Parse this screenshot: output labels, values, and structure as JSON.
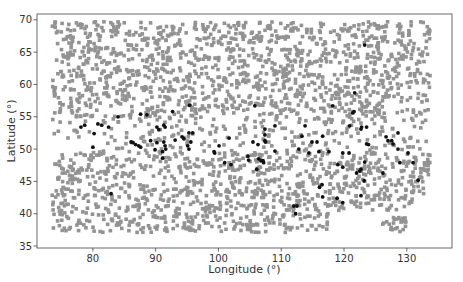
{
  "chart_data": {
    "type": "scatter",
    "title": "",
    "xlabel": "Longitude (°)",
    "ylabel": "Latitude (°)",
    "xlim": [
      71.1,
      137.2
    ],
    "ylim": [
      34.7,
      70.9
    ],
    "xticks": [
      80,
      90,
      100,
      110,
      120,
      130
    ],
    "yticks": [
      35,
      40,
      45,
      50,
      55,
      60,
      65,
      70
    ],
    "grid": false,
    "legend": null,
    "series": [
      {
        "name": "all_points",
        "color": "#939393",
        "marker_size": 4,
        "distribution": {
          "lon_range": [
            73.5,
            133.7
          ],
          "lat_range": [
            37.1,
            69.7
          ],
          "count": 2600,
          "seed": 7,
          "sparse_band_lat": [
            49.5,
            54.5
          ],
          "right_cutoff": {
            "lon_min": 117.5,
            "lat_max": 40.5
          },
          "right_cluster": {
            "lon_range": [
              126.0,
              130.0
            ],
            "lat_range": [
              37.2,
              39.5
            ],
            "count": 25
          }
        }
      },
      {
        "name": "highlighted_points",
        "color": "#111111",
        "marker_size": 4,
        "points": [
          [
            84.0,
            55.0
          ],
          [
            87.6,
            55.4
          ],
          [
            88.6,
            55.3
          ],
          [
            78.1,
            53.4
          ],
          [
            78.7,
            53.7
          ],
          [
            80.8,
            53.9
          ],
          [
            81.4,
            53.7
          ],
          [
            82.5,
            53.4
          ],
          [
            80.2,
            52.4
          ],
          [
            80.0,
            50.3
          ],
          [
            86.1,
            51.1
          ],
          [
            86.4,
            51.0
          ],
          [
            86.8,
            50.7
          ],
          [
            87.3,
            50.5
          ],
          [
            87.6,
            50.3
          ],
          [
            89.2,
            51.3
          ],
          [
            90.2,
            51.0
          ],
          [
            91.3,
            51.1
          ],
          [
            90.2,
            53.4
          ],
          [
            90.5,
            53.0
          ],
          [
            89.9,
            49.9
          ],
          [
            91.1,
            49.6
          ],
          [
            95.4,
            56.8
          ],
          [
            92.7,
            55.8
          ],
          [
            105.8,
            56.7
          ],
          [
            91.3,
            53.7
          ],
          [
            91.5,
            53.4
          ],
          [
            95.9,
            52.5
          ],
          [
            95.3,
            52.5
          ],
          [
            93.1,
            51.4
          ],
          [
            94.2,
            51.9
          ],
          [
            94.5,
            51.6
          ],
          [
            95.6,
            51.1
          ],
          [
            101.7,
            51.7
          ],
          [
            91.5,
            50.5
          ],
          [
            91.6,
            50.0
          ],
          [
            95.1,
            50.5
          ],
          [
            95.3,
            50.0
          ],
          [
            100.1,
            50.5
          ],
          [
            105.5,
            51.1
          ],
          [
            107.4,
            51.3
          ],
          [
            99.3,
            49.6
          ],
          [
            99.4,
            49.4
          ],
          [
            91.1,
            48.6
          ],
          [
            104.7,
            48.9
          ],
          [
            106.3,
            50.7
          ],
          [
            101.0,
            47.9
          ],
          [
            102.0,
            47.6
          ],
          [
            104.8,
            48.3
          ],
          [
            106.4,
            48.5
          ],
          [
            106.8,
            48.2
          ],
          [
            107.2,
            47.9
          ],
          [
            106.1,
            46.9
          ],
          [
            118.2,
            56.7
          ],
          [
            121.6,
            55.8
          ],
          [
            121.4,
            55.6
          ],
          [
            107.4,
            53.1
          ],
          [
            107.4,
            52.2
          ],
          [
            107.5,
            51.1
          ],
          [
            109.0,
            53.6
          ],
          [
            113.8,
            53.6
          ],
          [
            120.9,
            53.6
          ],
          [
            122.7,
            53.1
          ],
          [
            113.3,
            52.0
          ],
          [
            116.6,
            52.0
          ],
          [
            114.9,
            51.1
          ],
          [
            115.7,
            51.1
          ],
          [
            123.6,
            50.8
          ],
          [
            109.0,
            49.7
          ],
          [
            112.8,
            50.0
          ],
          [
            114.4,
            49.4
          ],
          [
            116.0,
            49.6
          ],
          [
            117.6,
            49.6
          ],
          [
            119.8,
            49.4
          ],
          [
            120.8,
            49.4
          ],
          [
            107.1,
            48.2
          ],
          [
            119.0,
            47.6
          ],
          [
            119.8,
            47.2
          ],
          [
            122.0,
            46.3
          ],
          [
            122.5,
            46.6
          ],
          [
            123.3,
            48.0
          ],
          [
            123.3,
            66.1
          ],
          [
            121.7,
            58.7
          ],
          [
            122.8,
            53.4
          ],
          [
            123.6,
            53.4
          ],
          [
            128.6,
            52.5
          ],
          [
            126.7,
            51.9
          ],
          [
            127.0,
            51.3
          ],
          [
            127.6,
            51.3
          ],
          [
            127.8,
            50.8
          ],
          [
            123.9,
            50.7
          ],
          [
            128.6,
            50.0
          ],
          [
            130.2,
            49.4
          ],
          [
            128.9,
            47.9
          ],
          [
            131.0,
            47.9
          ],
          [
            122.7,
            46.9
          ],
          [
            126.2,
            46.3
          ],
          [
            123.2,
            45.1
          ],
          [
            131.8,
            45.2
          ],
          [
            122.7,
            42.8
          ],
          [
            119.8,
            41.7
          ],
          [
            116.5,
            44.5
          ],
          [
            116.1,
            44.1
          ],
          [
            116.6,
            42.6
          ],
          [
            118.9,
            42.4
          ],
          [
            112.0,
            41.2
          ],
          [
            112.5,
            41.2
          ],
          [
            112.3,
            40.0
          ],
          [
            82.9,
            43.1
          ]
        ]
      }
    ]
  },
  "plot": {
    "frame": {
      "left": 37,
      "top": 14,
      "right": 452,
      "bottom": 248
    },
    "axis_color": "#444444",
    "xlabel": "Longitude (°)",
    "ylabel": "Latitude (°)"
  }
}
